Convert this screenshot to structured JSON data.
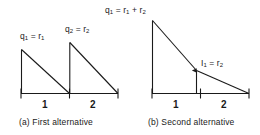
{
  "figure": {
    "background_color": "#ffffff",
    "ink_color": "#1a1a1a",
    "panels": [
      {
        "id": "a",
        "caption": "(a)  First alternative",
        "axis_tick_labels": [
          "1",
          "2"
        ],
        "peak_labels": [
          {
            "symbol": "q",
            "sub": "1",
            "rel": "=",
            "value": "r",
            "value_sub": "1"
          },
          {
            "symbol": "q",
            "sub": "2",
            "rel": "=",
            "value": "r",
            "value_sub": "2"
          }
        ],
        "label_text": [
          "q1 = r1",
          "q2 = r2"
        ],
        "description": "Two separate sawtooth depletion triangles, one per period"
      },
      {
        "id": "b",
        "caption": "(b)  Second alternative",
        "axis_tick_labels": [
          "1",
          "2"
        ],
        "peak_label": {
          "symbol": "q",
          "sub": "1",
          "rel": "=",
          "value1": "r",
          "value1_sub": "1",
          "op": "+",
          "value2": "r",
          "value2_sub": "2"
        },
        "interior_label": {
          "symbol": "I",
          "sub": "1",
          "rel": "=",
          "value": "r",
          "value_sub": "2"
        },
        "label_text": [
          "q1 = r1 + r2",
          "I1 = r2"
        ],
        "description": "Single large depletion line across both periods with interior level marked at period boundary"
      }
    ]
  },
  "chart_data": {
    "type": "line",
    "title": "",
    "xlabel": "",
    "ylabel": "",
    "xlim": [
      0,
      2
    ],
    "ylim": [
      0,
      2
    ],
    "grid": false,
    "legend": "none",
    "panels": [
      {
        "name": "(a)  First alternative",
        "categories": [
          "1",
          "2"
        ],
        "series": [
          {
            "name": "q1 = r1",
            "points": [
              [
                0,
                0
              ],
              [
                0,
                1
              ],
              [
                1,
                0
              ]
            ],
            "annotations": [
              "q1 = r1"
            ]
          },
          {
            "name": "q2 = r2",
            "points": [
              [
                1,
                0
              ],
              [
                1,
                1
              ],
              [
                2,
                0
              ]
            ],
            "annotations": [
              "q2 = r2"
            ]
          }
        ]
      },
      {
        "name": "(b)  Second alternative",
        "categories": [
          "1",
          "2"
        ],
        "series": [
          {
            "name": "q1 = r1 + r2",
            "points": [
              [
                0,
                0
              ],
              [
                0,
                2
              ],
              [
                1,
                1
              ],
              [
                2,
                0
              ]
            ],
            "annotations": [
              "q1 = r1 + r2",
              "I1 = r2"
            ]
          }
        ]
      }
    ]
  }
}
